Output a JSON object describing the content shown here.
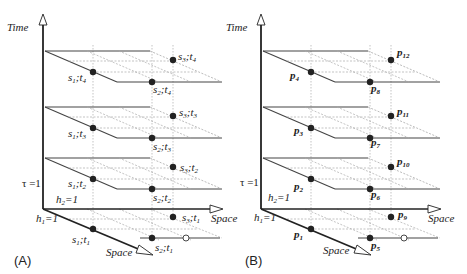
{
  "diagram": {
    "axes": {
      "time_label": "Time",
      "space_horizontal_label": "Space",
      "space_depth_label": "Space",
      "tau_label": "τ =1",
      "h1_label": "h",
      "h1_sub": "1",
      "h1_eq": "=1",
      "h2_label": "h",
      "h2_sub": "2",
      "h2_eq": "=1"
    },
    "panels": [
      {
        "id": "A",
        "label": "(A)",
        "points": [
          {
            "name": "s",
            "sub1": "1",
            "sep": ";",
            "t": "t",
            "sub2": "1",
            "col": 1,
            "level": 1
          },
          {
            "name": "s",
            "sub1": "2",
            "sep": ";",
            "t": "t",
            "sub2": "1",
            "col": 2,
            "level": 1
          },
          {
            "name": "s",
            "sub1": "3",
            "sep": ";",
            "t": "t",
            "sub2": "1",
            "col": 3,
            "level": 1
          },
          {
            "name": "s",
            "sub1": "1",
            "sep": ";",
            "t": "t",
            "sub2": "2",
            "col": 1,
            "level": 2
          },
          {
            "name": "s",
            "sub1": "2",
            "sep": ";",
            "t": "t",
            "sub2": "2",
            "col": 2,
            "level": 2
          },
          {
            "name": "s",
            "sub1": "3",
            "sep": ";",
            "t": "t",
            "sub2": "2",
            "col": 3,
            "level": 2
          },
          {
            "name": "s",
            "sub1": "1",
            "sep": ";",
            "t": "t",
            "sub2": "3",
            "col": 1,
            "level": 3
          },
          {
            "name": "s",
            "sub1": "2",
            "sep": ";",
            "t": "t",
            "sub2": "3",
            "col": 2,
            "level": 3
          },
          {
            "name": "s",
            "sub1": "3",
            "sep": ";",
            "t": "t",
            "sub2": "3",
            "col": 3,
            "level": 3
          },
          {
            "name": "s",
            "sub1": "1",
            "sep": ";",
            "t": "t",
            "sub2": "4",
            "col": 1,
            "level": 4
          },
          {
            "name": "s",
            "sub1": "2",
            "sep": ";",
            "t": "t",
            "sub2": "4",
            "col": 2,
            "level": 4
          },
          {
            "name": "s",
            "sub1": "3",
            "sep": ";",
            "t": "t",
            "sub2": "4",
            "col": 3,
            "level": 4
          }
        ]
      },
      {
        "id": "B",
        "label": "(B)",
        "points": [
          {
            "name": "p",
            "sub": "1"
          },
          {
            "name": "p",
            "sub": "5"
          },
          {
            "name": "p",
            "sub": "9"
          },
          {
            "name": "p",
            "sub": "2"
          },
          {
            "name": "p",
            "sub": "6"
          },
          {
            "name": "p",
            "sub": "10"
          },
          {
            "name": "p",
            "sub": "3"
          },
          {
            "name": "p",
            "sub": "7"
          },
          {
            "name": "p",
            "sub": "11"
          },
          {
            "name": "p",
            "sub": "4"
          },
          {
            "name": "p",
            "sub": "8"
          },
          {
            "name": "p",
            "sub": "12"
          }
        ]
      }
    ],
    "colors": {
      "line": "#333333",
      "grid": "#aaaaaa",
      "dot": "#222222"
    }
  }
}
